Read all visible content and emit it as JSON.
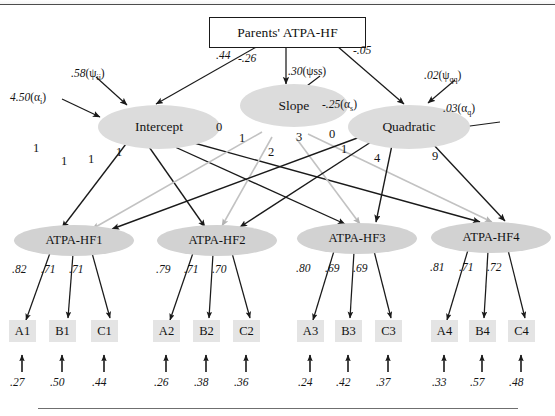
{
  "figure": {
    "type": "sem-path-diagram",
    "title_text": "",
    "exogenous": {
      "label": "Parents' ATPA-HF"
    },
    "growth_factors": [
      {
        "name": "intercept",
        "label": "Intercept"
      },
      {
        "name": "slope",
        "label": "Slope"
      },
      {
        "name": "quadratic",
        "label": "Quadratic"
      }
    ],
    "first_order_factors": [
      {
        "name": "atpa-hf1",
        "label": "ATPA-HF1"
      },
      {
        "name": "atpa-hf2",
        "label": "ATPA-HF2"
      },
      {
        "name": "atpa-hf3",
        "label": "ATPA-HF3"
      },
      {
        "name": "atpa-hf4",
        "label": "ATPA-HF4"
      }
    ],
    "indicators": [
      {
        "label": "A1"
      },
      {
        "label": "B1"
      },
      {
        "label": "C1"
      },
      {
        "label": "A2"
      },
      {
        "label": "B2"
      },
      {
        "label": "C2"
      },
      {
        "label": "A3"
      },
      {
        "label": "B3"
      },
      {
        "label": "C3"
      },
      {
        "label": "A4"
      },
      {
        "label": "B4"
      },
      {
        "label": "C4"
      }
    ],
    "structural_paths": [
      {
        "from": "Parents' ATPA-HF",
        "to": "Intercept",
        "value": ".44"
      },
      {
        "from": "Parents' ATPA-HF",
        "to": "Slope",
        "value": "-.26"
      },
      {
        "from": "Parents' ATPA-HF",
        "to": "Quadratic",
        "value": "-.05"
      }
    ],
    "variance_labels": [
      {
        "name": "psi-ii",
        "value": ".58",
        "param": "ψ",
        "subscript": "ii",
        "text": ".58(ψii)"
      },
      {
        "name": "alpha-i",
        "value": "4.50",
        "param": "α",
        "subscript": "i",
        "text": "4.50(αi)"
      },
      {
        "name": "psi-ss",
        "value": ".30",
        "param": "ψ",
        "subscript": "ss",
        "text": ".30(ψss)"
      },
      {
        "name": "alpha-s",
        "value": "-.25",
        "param": "α",
        "subscript": "s",
        "text": "-.25(αs)"
      },
      {
        "name": "psi-qq",
        "value": ".02",
        "param": "ψ",
        "subscript": "qq",
        "text": ".02(ψqq)"
      },
      {
        "name": "alpha-q",
        "value": ".03",
        "param": "α",
        "subscript": "q",
        "text": ".03(αq)"
      }
    ],
    "growth_loadings": {
      "intercept": [
        "1",
        "1",
        "1",
        "1"
      ],
      "slope": [
        "0",
        "1",
        "2",
        "3"
      ],
      "quadratic": [
        "0",
        "1",
        "4",
        "9"
      ]
    },
    "factor_loadings": [
      {
        "factor": "ATPA-HF1",
        "values": [
          ".82",
          ".71",
          ".71"
        ]
      },
      {
        "factor": "ATPA-HF2",
        "values": [
          ".79",
          ".71",
          ".70"
        ]
      },
      {
        "factor": "ATPA-HF3",
        "values": [
          ".80",
          ".69",
          ".69"
        ]
      },
      {
        "factor": "ATPA-HF4",
        "values": [
          ".81",
          ".71",
          ".72"
        ]
      }
    ],
    "residuals": [
      {
        "indicator": "A1",
        "value": ".27"
      },
      {
        "indicator": "B1",
        "value": ".50"
      },
      {
        "indicator": "C1",
        "value": ".44"
      },
      {
        "indicator": "A2",
        "value": ".26"
      },
      {
        "indicator": "B2",
        "value": ".38"
      },
      {
        "indicator": "C2",
        "value": ".36"
      },
      {
        "indicator": "A3",
        "value": ".24"
      },
      {
        "indicator": "B3",
        "value": ".42"
      },
      {
        "indicator": "C3",
        "value": ".37"
      },
      {
        "indicator": "A4",
        "value": ".33"
      },
      {
        "indicator": "B4",
        "value": ".57"
      },
      {
        "indicator": "C4",
        "value": ".48"
      }
    ],
    "colors": {
      "latent_fill": "#dcdcdc",
      "indicator_fill": "#e4e4e4",
      "path_black": "#1a1a1a",
      "path_gray": "#b8b8b8"
    }
  }
}
